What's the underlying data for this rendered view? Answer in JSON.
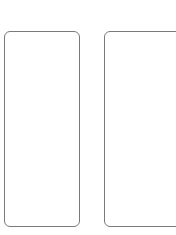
{
  "canvas": {
    "width": 176,
    "height": 235,
    "background": "#ffffff"
  },
  "frames": [
    {
      "id": "left",
      "shape": "rounded-rectangle",
      "border_color": "#7a7a7a",
      "content": ""
    },
    {
      "id": "right",
      "shape": "rounded-rectangle",
      "border_color": "#7a7a7a",
      "content": "",
      "clipped": true
    }
  ]
}
